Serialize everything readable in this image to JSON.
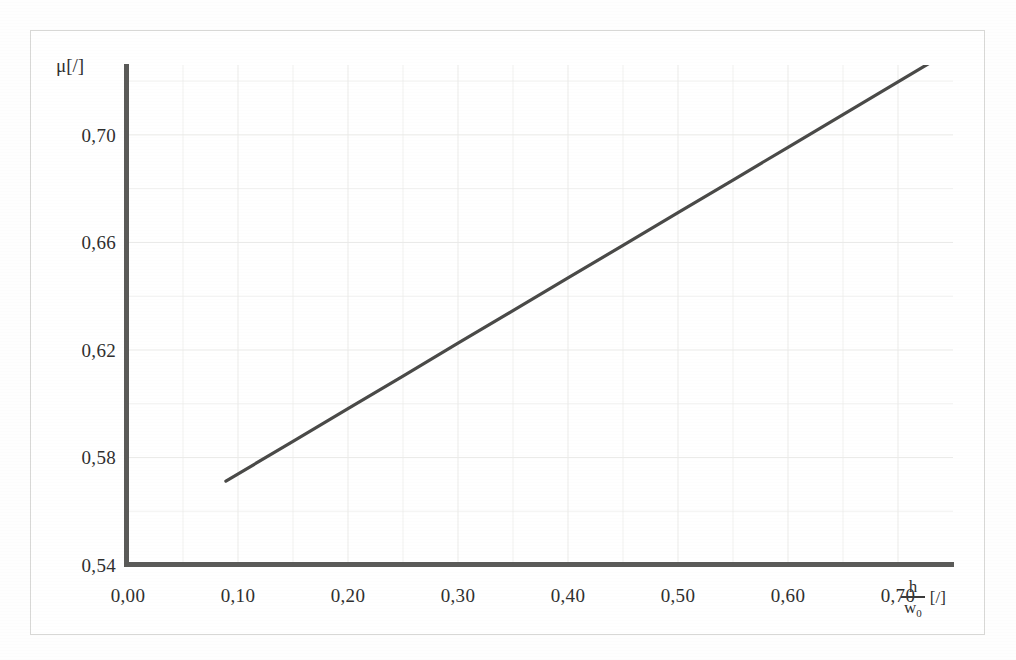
{
  "figure": {
    "background_color": "#ffffff",
    "frame_color": "#d8d8d6",
    "axis_color": "#5a5a58",
    "grid_color": "#ebebe9",
    "line_color": "#4a4a48"
  },
  "axes": {
    "y_axis_title": "μ[/]",
    "x_axis_title_numerator": "h",
    "x_axis_title_denominator": "w",
    "x_axis_title_denominator_sub": "0",
    "x_axis_unit": "[/]"
  },
  "chart_data": {
    "type": "line",
    "title": "",
    "subtitle": "",
    "xlabel": "h/w₀ [/]",
    "ylabel": "μ [/]",
    "xlim": [
      0.0,
      0.75
    ],
    "ylim": [
      0.54,
      0.726
    ],
    "grid": true,
    "minor_grid": true,
    "legend": null,
    "legend_position": "none",
    "x_tick_labels": [
      "0,00",
      "0,10",
      "0,20",
      "0,30",
      "0,40",
      "0,50",
      "0,60",
      "0,70"
    ],
    "x_tick_values": [
      0.0,
      0.1,
      0.2,
      0.3,
      0.4,
      0.5,
      0.6,
      0.7
    ],
    "y_tick_labels": [
      "0,70",
      "0,66",
      "0,62",
      "0,58",
      "0,54"
    ],
    "y_tick_values": [
      0.7,
      0.66,
      0.62,
      0.58,
      0.54
    ],
    "series": [
      {
        "name": "mu",
        "style": "solid",
        "color": "#4a4a48",
        "x": [
          0.089,
          0.15,
          0.2,
          0.25,
          0.3,
          0.35,
          0.4,
          0.45,
          0.5,
          0.55,
          0.6,
          0.65,
          0.7,
          0.734
        ],
        "y": [
          0.5712,
          0.586,
          0.5982,
          0.6103,
          0.6225,
          0.6346,
          0.6468,
          0.6589,
          0.6711,
          0.6832,
          0.6954,
          0.7075,
          0.7197,
          0.728
        ]
      }
    ],
    "annotations": []
  }
}
